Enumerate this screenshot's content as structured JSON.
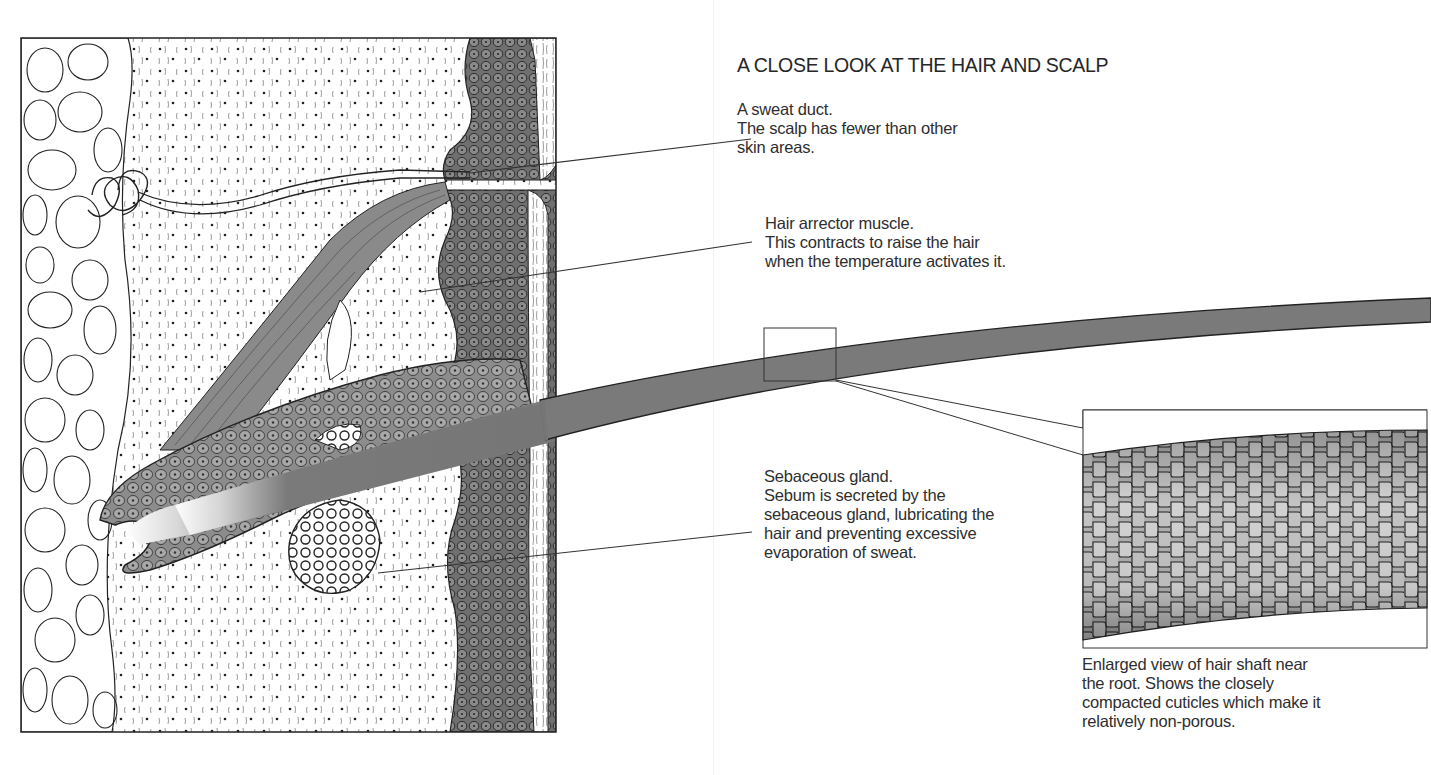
{
  "page": {
    "title": "A CLOSE LOOK AT THE HAIR AND SCALP",
    "colors": {
      "ink": "#2a2a2a",
      "tissue_dark": "#6e6e6e",
      "tissue_mid": "#9a9a9a",
      "hair": "#7a7a7a",
      "paper": "#ffffff"
    }
  },
  "labels": {
    "sweat_duct": {
      "lines": [
        "A sweat duct.",
        "The scalp has fewer than other",
        "skin areas."
      ]
    },
    "arrector_muscle": {
      "lines": [
        "Hair arrector muscle.",
        "This contracts to raise the hair",
        "when the temperature activates it."
      ]
    },
    "sebaceous_gland": {
      "lines": [
        "Sebaceous gland.",
        "Sebum is secreted by the",
        "sebaceous gland, lubricating the",
        "hair and preventing excessive",
        "evaporation of sweat."
      ]
    },
    "enlarged_view": {
      "lines": [
        "Enlarged view of hair shaft near",
        "the root. Shows the closely",
        "compacted cuticles which make it",
        "relatively non-porous."
      ]
    }
  },
  "illustration": {
    "subject": "cross-section of scalp skin with hair follicle",
    "parts": [
      "fat-cells",
      "dermis",
      "sweat-gland",
      "sweat-duct",
      "epidermis",
      "hair-follicle",
      "arrector-muscle",
      "sebaceous-gland",
      "hair-shaft"
    ],
    "inset": "enlarged-hair-shaft-cuticles"
  }
}
